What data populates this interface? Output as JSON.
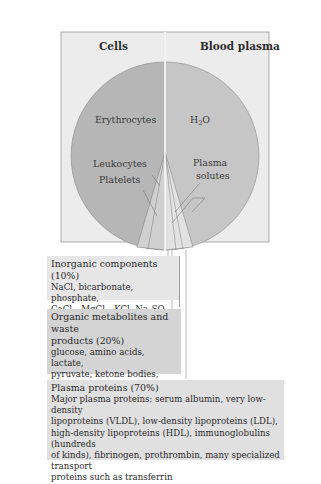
{
  "panels": {
    "left_title": "Cells",
    "right_title": "Blood plasma"
  },
  "pie_labels": {
    "erythrocytes": "Erythrocytes",
    "water": "H",
    "water_sub": "2",
    "water_tail": "O",
    "leukocytes": "Leukocytes",
    "platelets": "Platelets",
    "plasma_solutes_1": "Plasma",
    "plasma_solutes_2": "solutes"
  },
  "boxes": {
    "inorganic": {
      "title": "Inorganic components (10%)",
      "line1": "NaCl, bicarbonate, phosphate,",
      "line2_parts": [
        "CaCl",
        "2",
        ", MgCl",
        "2",
        ", KCl, Na",
        "2",
        "SO",
        "4"
      ]
    },
    "organic": {
      "title_1": "Organic metabolites and waste",
      "title_2": "products (20%)",
      "lines": [
        "glucose, amino acids, lactate,",
        "pyruvate, ketone bodies,",
        "citrate, urea, uric acid"
      ]
    },
    "proteins": {
      "title": "Plasma proteins (70%)",
      "lines": [
        "Major plasma proteins:  serum albumin, very low-density",
        "lipoproteins (VLDL), low-density lipoproteins (LDL),",
        "high-density lipoproteins (HDL), immunoglobulins (hundreds",
        "of kinds), fibrinogen, prothrombin, many specialized transport",
        "proteins such as transferrin"
      ]
    }
  },
  "colors": {
    "panel_bg": "#ececec",
    "cells_pie": "#b4b4b4",
    "plasma_pie": "#c4c4c4",
    "box_light": "#e6e6e6",
    "box_dark": "#d4d4d4",
    "box_mid": "#e0e0e0"
  }
}
